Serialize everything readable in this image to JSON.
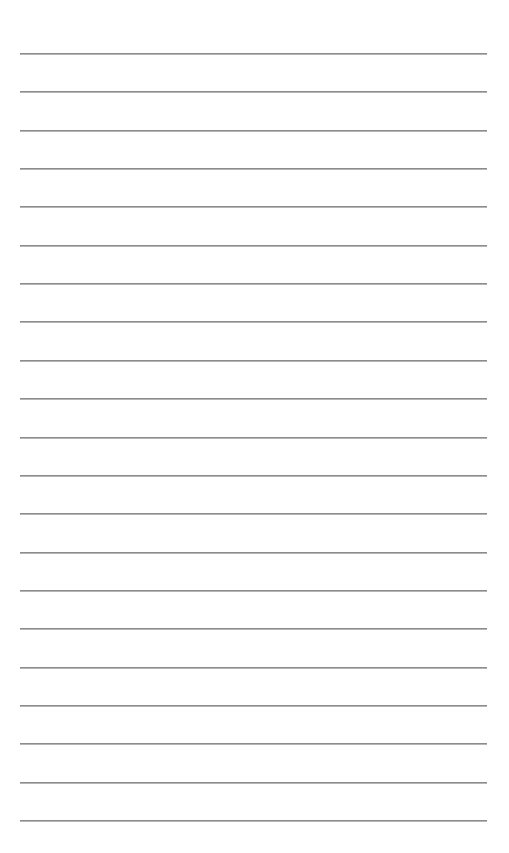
{
  "page": {
    "type": "lined-paper",
    "line_count": 21,
    "line_color": "#8c8c8c",
    "background_color": "#ffffff",
    "text_content": []
  }
}
